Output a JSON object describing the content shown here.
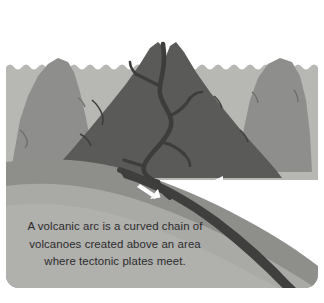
{
  "figure": {
    "caption_lines": [
      "A volcanic arc is a curved chain of",
      "volcanoes created above an area",
      "where tectonic plates meet."
    ],
    "caption_full": "A volcanic arc is a curved chain of volcanoes created above an area where tectonic plates meet.",
    "background_color": "#ffffff",
    "panel": {
      "rounded_corners": true,
      "corner_radius_px": 13,
      "x": 6,
      "y": 6,
      "width": 312,
      "height": 282
    }
  },
  "palette": {
    "sky": "#ffffff",
    "smoke": "#dddcd8",
    "water": "#b7b7b4",
    "far_mountain": "#8e8e8c",
    "mid_mountain": "#7b7b79",
    "volcano": "#5a5a59",
    "magma_channel": "#3d3d3c",
    "upper_plate": "#8e8e8b",
    "crust_band": "#7f7f7d",
    "mantle": "#a9a9a6",
    "deep_mantle": "#9b9b98",
    "slab": "#3f3f3e",
    "arrow": "#ffffff",
    "caption_text": "#2b2b2b"
  },
  "elements": {
    "smoke_plume": {
      "name": "smoke plume",
      "description": "pale gray eruption cloud rising from the volcano summit"
    },
    "volcano": {
      "name": "central volcano",
      "description": "large dark gray cone with summit crater"
    },
    "left_mountain": {
      "name": "left background mountain",
      "description": "medium gray peak behind the water surface"
    },
    "right_mountain": {
      "name": "right background mountain",
      "description": "medium gray peak behind the water surface"
    },
    "magma_channel": {
      "name": "magma conduit",
      "description": "dark winding channel with branches feeding the volcano from the subducting slab"
    },
    "water_surface": {
      "name": "ocean surface",
      "description": "scalloped wavy horizon line across the diagram"
    },
    "subducting_slab": {
      "name": "subducting plate",
      "description": "dark diagonal band descending to the lower right"
    },
    "upper_plate": {
      "name": "overriding plate",
      "description": "gray crust layer sloping down from left"
    },
    "mantle": {
      "name": "mantle",
      "description": "light gray region beneath the crust layers"
    }
  },
  "arrows": [
    {
      "id": "arrow-down-right",
      "direction": "down-right",
      "meaning": "subducting plate motion",
      "color": "#ffffff"
    },
    {
      "id": "arrow-left",
      "direction": "left",
      "meaning": "oceanic plate converging motion",
      "color": "#ffffff"
    }
  ]
}
